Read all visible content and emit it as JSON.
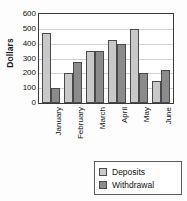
{
  "chart_data": {
    "type": "bar",
    "title": "",
    "xlabel": "",
    "ylabel": "Dollars",
    "ylim": [
      0,
      600
    ],
    "yticks": [
      0,
      100,
      200,
      300,
      400,
      500,
      600
    ],
    "ytick_labels": [
      "0",
      "100",
      "200",
      "300",
      "400",
      "500",
      "600"
    ],
    "grid": true,
    "legend_position": "bottom-right",
    "categories": [
      "January",
      "February",
      "March",
      "April",
      "May",
      "June"
    ],
    "series": [
      {
        "name": "Deposits",
        "color": "#c9c9c9",
        "values": [
          475,
          200,
          350,
          425,
          500,
          150
        ]
      },
      {
        "name": "Withdrawal",
        "color": "#8b8b8b",
        "values": [
          100,
          275,
          350,
          400,
          200,
          225
        ]
      }
    ]
  },
  "legend": {
    "items": [
      {
        "label": "Deposits",
        "swatch": "deposits"
      },
      {
        "label": "Withdrawal",
        "swatch": "withdrawal"
      }
    ]
  }
}
